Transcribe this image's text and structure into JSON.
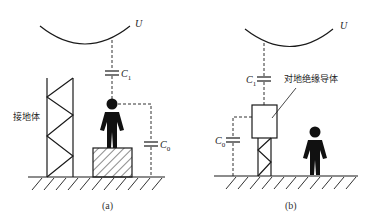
{
  "diagram": {
    "colors": {
      "stroke": "#1a1a1a",
      "background": "#ffffff"
    },
    "panel_a": {
      "voltage_label": "U",
      "c1_label": "C",
      "c1_sub": "1",
      "c0_label": "C",
      "c0_sub": "0",
      "ground_body_label": "接地体",
      "caption": "(a)"
    },
    "panel_b": {
      "voltage_label": "U",
      "c1_label": "C",
      "c1_sub": "1",
      "c0_label": "C",
      "c0_sub": "0",
      "insulated_conductor_label": "对地绝缘导体",
      "caption": "(b)"
    }
  }
}
